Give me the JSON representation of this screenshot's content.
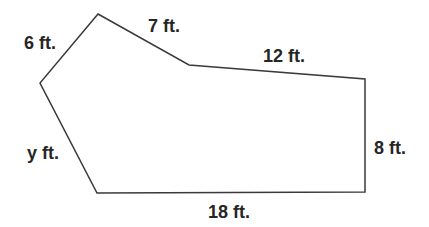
{
  "figure": {
    "type": "polygon",
    "stroke_color": "#3a3a3a",
    "vertices": [
      {
        "id": "top",
        "x": 98,
        "y": 14
      },
      {
        "id": "inner",
        "x": 189,
        "y": 65
      },
      {
        "id": "top-right",
        "x": 365,
        "y": 79
      },
      {
        "id": "bottom-right",
        "x": 365,
        "y": 192
      },
      {
        "id": "bottom-left",
        "x": 97,
        "y": 193
      },
      {
        "id": "left",
        "x": 40,
        "y": 83
      }
    ],
    "points": "98,14 189,65 365,79 365,192 97,193 40,83"
  },
  "labels": {
    "side_top_left": "6 ft.",
    "side_top": "7 ft.",
    "side_top_right": "12 ft.",
    "side_right": "8 ft.",
    "side_bottom": "18 ft.",
    "side_left": "y ft."
  }
}
